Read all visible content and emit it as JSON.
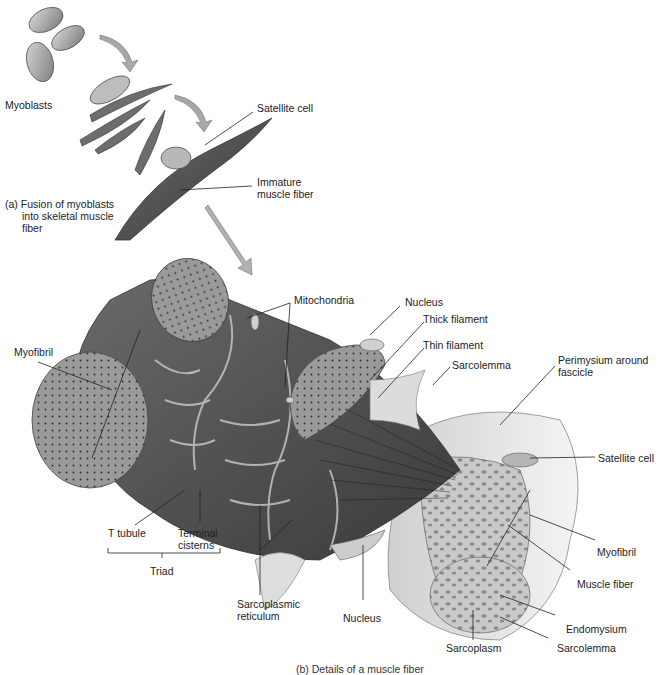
{
  "figure": {
    "panel_a": {
      "caption_line1": "(a) Fusion of myoblasts",
      "caption_line2": "into skeletal muscle",
      "caption_line3": "fiber",
      "labels": {
        "myoblasts": "Myoblasts",
        "satellite_cell": "Satellite cell",
        "immature_fiber_line1": "Immature",
        "immature_fiber_line2": "muscle fiber"
      }
    },
    "panel_b": {
      "caption": "(b) Details of a muscle fiber",
      "labels": {
        "myofibril_left": "Myofibril",
        "mitochondria": "Mitochondria",
        "nucleus_top": "Nucleus",
        "thick_filament": "Thick filament",
        "thin_filament": "Thin filament",
        "sarcolemma_top": "Sarcolemma",
        "perimysium_line1": "Perimysium around",
        "perimysium_line2": "fascicle",
        "satellite_cell": "Satellite cell",
        "myofibril_right": "Myofibril",
        "muscle_fiber": "Muscle fiber",
        "endomysium": "Endomysium",
        "sarcolemma_bottom": "Sarcolemma",
        "sarcoplasm": "Sarcoplasm",
        "nucleus_bottom": "Nucleus",
        "sarcoplasmic_line1": "Sarcoplasmic",
        "sarcoplasmic_line2": "reticulum",
        "t_tubule": "T tubule",
        "terminal_line1": "Terminal",
        "terminal_line2": "cisterns",
        "triad": "Triad"
      }
    },
    "colors": {
      "background": "#ffffff",
      "tissue_dark": "#5a5a5a",
      "tissue_mid": "#8a8a8a",
      "tissue_light": "#bdbdbd",
      "leader_line": "#222222",
      "arrow_fill": "#a8a8a8"
    }
  }
}
